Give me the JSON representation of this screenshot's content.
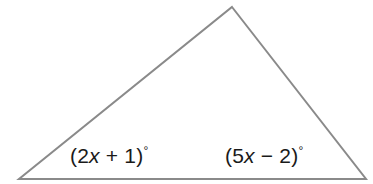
{
  "figure": {
    "type": "geometry-diagram",
    "shape": "triangle",
    "background_color": "#ffffff",
    "stroke_color": "#8a8a8a",
    "stroke_width": 2,
    "width": 373,
    "height": 184,
    "vertices": {
      "apex": {
        "x": 232,
        "y": 7
      },
      "bottom_left": {
        "x": 19,
        "y": 179
      },
      "bottom_right": {
        "x": 366,
        "y": 179
      }
    },
    "polygon_points": "232,7 366,179 19,179"
  },
  "labels": {
    "left_angle": {
      "open_paren": "(",
      "coefficient": "2",
      "variable": "x",
      "operator": " + ",
      "constant": "1",
      "close_paren": ")",
      "degree": "°",
      "full_text": "(2x + 1)°"
    },
    "right_angle": {
      "open_paren": "(",
      "coefficient": "5",
      "variable": "x",
      "operator": " − ",
      "constant": "2",
      "close_paren": ")",
      "degree": "°",
      "full_text": "(5x − 2)°"
    }
  },
  "text_color": "#1a1a1a"
}
